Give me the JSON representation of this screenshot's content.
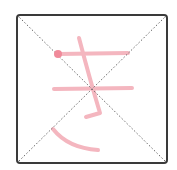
{
  "character": "き",
  "grid": {
    "border_color": "#3a3a3a",
    "guide_color": "#666666",
    "box": {
      "x": 17,
      "y": 15,
      "w": 150,
      "h": 148,
      "rx": 3
    }
  },
  "strokes": {
    "color": "#f4b6bf",
    "start_dot_color": "#f08a9a",
    "paths": [
      "M58 54 L128 53",
      "M54 89 L132 88",
      "M79 38 Q90 80 100 113 L86 117",
      "M53 129 Q68 148 98 150"
    ],
    "start_dot": {
      "cx": 58,
      "cy": 54,
      "r": 4
    }
  }
}
